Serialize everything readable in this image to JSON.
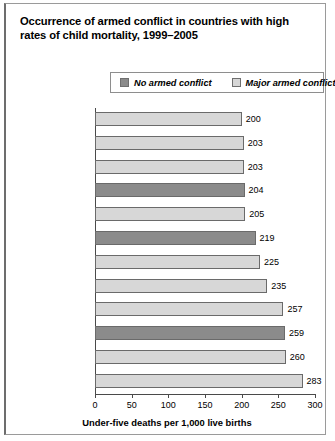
{
  "title": "Occurrence of armed conflict in countries with high rates of child mortality, 1999–2005",
  "legend": {
    "items": [
      {
        "label": "No armed conflict",
        "swatch": "dark",
        "color": "#8b8b8b"
      },
      {
        "label": "Major armed conflict",
        "swatch": "light",
        "color": "#d7d7d7"
      }
    ]
  },
  "axis": {
    "ticks": [
      "0",
      "50",
      "100",
      "150",
      "200",
      "250",
      "300"
    ],
    "xlabel": "Under-five deaths per 1,000 live births"
  },
  "chart_data": {
    "type": "bar",
    "orientation": "horizontal",
    "title": "Occurrence of armed conflict in countries with high rates of child mortality, 1999–2005",
    "xlabel": "Under-five deaths per 1,000 live births",
    "ylabel": "",
    "xlim": [
      0,
      300
    ],
    "xticks": [
      0,
      50,
      100,
      150,
      200,
      250,
      300
    ],
    "grid": false,
    "legend_position": "top",
    "categories": [
      "Chad",
      "Rwanda",
      "Guinea-Bissau",
      "Equatorial Guinea",
      "Democratic Republic\nof Congo",
      "Mali",
      "Somalia",
      "Liberia",
      "Afghanistan",
      "Niger",
      "Angola",
      "Sierra Leone"
    ],
    "values": [
      200,
      203,
      203,
      204,
      205,
      219,
      225,
      235,
      257,
      259,
      260,
      283
    ],
    "value_labels": [
      "200",
      "203",
      "203",
      "204",
      "205",
      "219",
      "225",
      "235",
      "257",
      "259",
      "260",
      "283"
    ],
    "groups": [
      "Major armed conflict",
      "Major armed conflict",
      "Major armed conflict",
      "No armed conflict",
      "Major armed conflict",
      "No armed conflict",
      "Major armed conflict",
      "Major armed conflict",
      "Major armed conflict",
      "No armed conflict",
      "Major armed conflict",
      "Major armed conflict"
    ],
    "series": [
      {
        "name": "No armed conflict",
        "color": "#8b8b8b",
        "points": [
          {
            "category": "Equatorial Guinea",
            "value": 204
          },
          {
            "category": "Mali",
            "value": 219
          },
          {
            "category": "Niger",
            "value": 259
          }
        ]
      },
      {
        "name": "Major armed conflict",
        "color": "#d7d7d7",
        "points": [
          {
            "category": "Chad",
            "value": 200
          },
          {
            "category": "Rwanda",
            "value": 203
          },
          {
            "category": "Guinea-Bissau",
            "value": 203
          },
          {
            "category": "Democratic Republic of Congo",
            "value": 205
          },
          {
            "category": "Somalia",
            "value": 225
          },
          {
            "category": "Liberia",
            "value": 235
          },
          {
            "category": "Afghanistan",
            "value": 257
          },
          {
            "category": "Angola",
            "value": 260
          },
          {
            "category": "Sierra Leone",
            "value": 283
          }
        ]
      }
    ]
  }
}
